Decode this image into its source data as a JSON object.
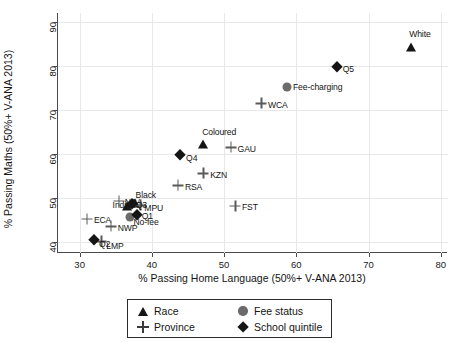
{
  "chart_data": {
    "type": "scatter",
    "title": "",
    "xlabel": "% Passing Home Language (50%+ V-ANA 2013)",
    "ylabel": "% Passing Maths (50%+ V-ANA 2013)",
    "xlim": [
      27,
      81
    ],
    "ylim": [
      37.5,
      92
    ],
    "xticks": [
      30,
      40,
      50,
      60,
      70,
      80
    ],
    "yticks": [
      40,
      50,
      60,
      70,
      80,
      90
    ],
    "grid": true,
    "legend_position": "below-axes",
    "series": [
      {
        "name": "Race",
        "marker": "triangle",
        "color": "#151515",
        "points": [
          {
            "label": "White",
            "x": 75.9,
            "y": 84.3,
            "label_dx": -2,
            "label_dy": -13
          },
          {
            "label": "Coloured",
            "x": 47.1,
            "y": 62.2,
            "label_dx": -1,
            "label_dy": -13
          },
          {
            "label": "Indian",
            "x": 36.5,
            "y": 48.2,
            "label_dx": -14,
            "label_dy": -1
          },
          {
            "label": "Black",
            "x": 37.6,
            "y": 48.9,
            "label_dx": 1,
            "label_dy": -8
          }
        ]
      },
      {
        "name": "Fee status",
        "marker": "circle",
        "color": "#6b6b6b",
        "points": [
          {
            "label": "Fee-charging",
            "x": 58.7,
            "y": 75.3,
            "label_dx": 6,
            "label_dy": 0
          },
          {
            "label": "No-fee",
            "x": 36.9,
            "y": 45.6,
            "label_dx": 4,
            "label_dy": 4
          }
        ]
      },
      {
        "name": "Province",
        "marker": "plus",
        "color": "#5a5a5a",
        "points": [
          {
            "label": "WCA",
            "x": 55.1,
            "y": 71.5,
            "label_dx": 7,
            "label_dy": 1
          },
          {
            "label": "GAU",
            "x": 50.9,
            "y": 61.5,
            "label_dx": 7,
            "label_dy": 1
          },
          {
            "label": "KZN",
            "x": 47.1,
            "y": 55.6,
            "label_dx": 7,
            "label_dy": 1
          },
          {
            "label": "RSA",
            "x": 43.6,
            "y": 52.9,
            "label_dx": 7,
            "label_dy": 1
          },
          {
            "label": "FST",
            "x": 51.5,
            "y": 48.2,
            "label_dx": 7,
            "label_dy": 1
          },
          {
            "label": "NCA",
            "x": 35.4,
            "y": 49.4,
            "label_dx": 6,
            "label_dy": 1
          },
          {
            "label": "MPU",
            "x": 38.4,
            "y": 48.4,
            "label_dx": 4,
            "label_dy": 2
          },
          {
            "label": "ECA",
            "x": 31.0,
            "y": 45.3,
            "label_dx": 7,
            "label_dy": 1
          },
          {
            "label": "NWP",
            "x": 34.3,
            "y": 43.6,
            "label_dx": 7,
            "label_dy": 1
          },
          {
            "label": "LMP",
            "x": 33.0,
            "y": 40.2,
            "label_dx": 5,
            "label_dy": 4
          }
        ]
      },
      {
        "name": "School quintile",
        "marker": "diamond",
        "color": "#151515",
        "points": [
          {
            "label": "Q5",
            "x": 65.6,
            "y": 79.8,
            "label_dx": 6,
            "label_dy": 2
          },
          {
            "label": "Q4",
            "x": 43.9,
            "y": 59.7,
            "label_dx": 6,
            "label_dy": 2
          },
          {
            "label": "Q3",
            "x": 37.2,
            "y": 48.6,
            "label_dx": 4,
            "label_dy": 0
          },
          {
            "label": "Q1",
            "x": 37.9,
            "y": 46.1,
            "label_dx": 5,
            "label_dy": 0
          },
          {
            "label": "Q2",
            "x": 32.0,
            "y": 40.4,
            "label_dx": 5,
            "label_dy": 3
          }
        ]
      }
    ]
  },
  "axes": {
    "x_title": "% Passing Home Language (50%+ V-ANA 2013)",
    "y_title": "% Passing Maths (50%+ V-ANA 2013)",
    "x_ticks": [
      "30",
      "40",
      "50",
      "60",
      "70",
      "80"
    ],
    "y_ticks": [
      "40",
      "50",
      "60",
      "70",
      "80",
      "90"
    ]
  },
  "legend": {
    "entries": [
      {
        "label": "Race",
        "marker": "triangle"
      },
      {
        "label": "Fee status",
        "marker": "circle"
      },
      {
        "label": "Province",
        "marker": "plus"
      },
      {
        "label": "School quintile",
        "marker": "diamond"
      }
    ]
  }
}
